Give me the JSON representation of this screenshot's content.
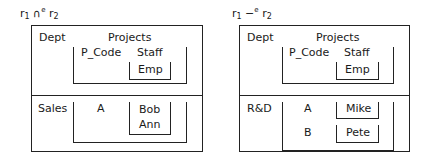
{
  "left": {
    "title": {
      "r1": "r",
      "sub1": "1",
      "op": " ∩",
      "sup": "e",
      "r2": " r",
      "sub2": "2"
    },
    "header": {
      "dept": "Dept",
      "projects": "Projects",
      "p_code": "P_Code",
      "staff": "Staff",
      "emp": "Emp"
    },
    "rows": [
      {
        "dept": "Sales",
        "projects": [
          {
            "p_code": "A",
            "staff": [
              "Bob",
              "Ann"
            ]
          }
        ]
      }
    ]
  },
  "right": {
    "title": {
      "r1": "r",
      "sub1": "1",
      "op": " −",
      "sup": "e",
      "r2": " r",
      "sub2": "2"
    },
    "header": {
      "dept": "Dept",
      "projects": "Projects",
      "p_code": "P_Code",
      "staff": "Staff",
      "emp": "Emp"
    },
    "rows": [
      {
        "dept": "R&D",
        "projects": [
          {
            "p_code": "A",
            "staff": [
              "Mike"
            ]
          },
          {
            "p_code": "B",
            "staff": [
              "Pete"
            ]
          }
        ]
      }
    ]
  }
}
